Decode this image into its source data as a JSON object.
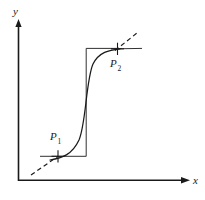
{
  "figure": {
    "type": "diagram",
    "title": "",
    "background_color": "#ffffff",
    "stroke_color": "#1a1a1a",
    "axes": {
      "x_label": "x",
      "y_label": "y",
      "origin": [
        18,
        180
      ],
      "x_axis_end": [
        190,
        180
      ],
      "y_axis_end": [
        18,
        20
      ],
      "arrowheads": true,
      "ticks": [],
      "tick_labels": []
    },
    "points": [
      {
        "id": "P1",
        "label": "P",
        "subscript": "1",
        "marker": "plus-cross",
        "marker_position": [
          58,
          156
        ],
        "label_position": [
          52,
          133
        ]
      },
      {
        "id": "P2",
        "label": "P",
        "subscript": "2",
        "marker": "plus-cross",
        "marker_position": [
          117,
          50
        ],
        "label_position": [
          113,
          72
        ]
      }
    ],
    "step_outline": {
      "description": "rectangular step polyline through P1 and P2",
      "vertices": [
        [
          40,
          156
        ],
        [
          86,
          156
        ],
        [
          86,
          48
        ],
        [
          115,
          48
        ]
      ],
      "style": "solid-thin"
    },
    "curve": {
      "description": "sigmoid S-curve from P1 to P2",
      "start": [
        58,
        156
      ],
      "end": [
        117,
        50
      ],
      "style": "solid",
      "control_points": [
        [
          78,
          155
        ],
        [
          93,
          52
        ]
      ]
    },
    "tangents": [
      {
        "at": "P1",
        "style": "dashed",
        "from": [
          32,
          174
        ],
        "to": [
          62,
          150
        ]
      },
      {
        "at": "P2",
        "style": "dashed",
        "from": [
          114,
          54
        ],
        "to": [
          136,
          34
        ]
      }
    ],
    "right_segment": {
      "description": "solid horizontal segment right of P2",
      "from": [
        117,
        50
      ],
      "to": [
        142,
        49
      ]
    }
  }
}
